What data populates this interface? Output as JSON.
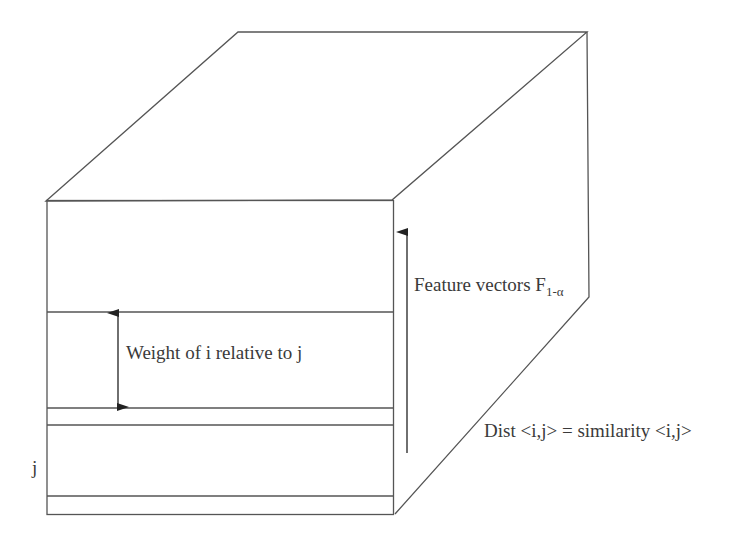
{
  "diagram": {
    "type": "3d-box",
    "labels": {
      "weight": "Weight of i relative to j",
      "feature_vectors": "Feature vectors F",
      "feature_subscript": "1-α",
      "dist": "Dist <i,j> = similarity <i,j>",
      "j": "j"
    },
    "colors": {
      "stroke": "#555555",
      "text": "#3a3a3a",
      "background": "#ffffff"
    }
  }
}
